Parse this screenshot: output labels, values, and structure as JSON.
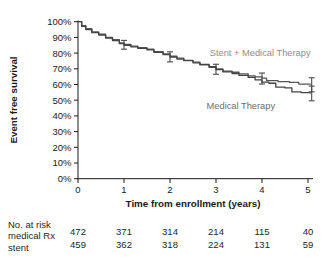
{
  "chart_data": {
    "type": "line",
    "subtype": "kaplan-meier-step",
    "title": "",
    "xlabel": "Time from enrollment (years)",
    "ylabel": "Event free survival",
    "xlim": [
      0,
      5
    ],
    "ylim": [
      0,
      100
    ],
    "grid": false,
    "legend_position": "inline-annotations",
    "x_axis": {
      "tick_values": [
        0,
        1,
        2,
        3,
        4,
        5
      ],
      "tick_labels": [
        "0",
        "1",
        "2",
        "3",
        "4",
        "5"
      ]
    },
    "y_axis": {
      "tick_values": [
        0,
        10,
        20,
        30,
        40,
        50,
        60,
        70,
        80,
        90,
        100
      ],
      "tick_labels": [
        "0%",
        "10%",
        "20%",
        "30%",
        "40%",
        "50%",
        "60%",
        "70%",
        "80%",
        "90%",
        "100%"
      ]
    },
    "series": [
      {
        "name": "Stent + Medical Therapy",
        "color": "#555555",
        "x": [
          0,
          0.08,
          0.17,
          0.3,
          0.45,
          0.6,
          0.75,
          0.9,
          1.0,
          1.15,
          1.3,
          1.5,
          1.65,
          1.85,
          2.0,
          2.15,
          2.3,
          2.5,
          2.65,
          2.85,
          3.0,
          3.15,
          3.35,
          3.5,
          3.7,
          3.85,
          4.0,
          4.1,
          4.35,
          4.6,
          4.8,
          5.05
        ],
        "values": [
          100,
          97.5,
          95.5,
          93.5,
          92,
          90,
          88.5,
          86.5,
          85.5,
          84.5,
          83.5,
          82.5,
          81,
          79.5,
          78,
          76.8,
          75.2,
          74.3,
          72.5,
          71,
          70,
          68.5,
          67.8,
          66.8,
          65.5,
          64.8,
          64,
          62.5,
          61.8,
          61.3,
          60.3,
          59.8
        ]
      },
      {
        "name": "Medical Therapy",
        "color": "#434343",
        "x": [
          0,
          0.08,
          0.17,
          0.3,
          0.45,
          0.6,
          0.75,
          0.9,
          1.0,
          1.15,
          1.3,
          1.5,
          1.65,
          1.85,
          2.0,
          2.15,
          2.3,
          2.5,
          2.65,
          2.85,
          3.0,
          3.15,
          3.35,
          3.5,
          3.7,
          3.85,
          4.0,
          4.15,
          4.3,
          4.5,
          4.65,
          4.85,
          5.05
        ],
        "values": [
          100,
          97,
          95,
          93,
          91.5,
          89.5,
          88,
          86,
          85,
          84,
          83,
          82,
          80.5,
          79,
          77.5,
          76.2,
          75.4,
          73.8,
          72.8,
          71.3,
          69.5,
          68,
          67,
          65.8,
          64.5,
          63,
          61.5,
          60.8,
          58.3,
          57.8,
          55.3,
          54.8,
          54.3
        ]
      }
    ],
    "error_bars": [
      {
        "x": 1,
        "y": 85.3,
        "err": 2.8
      },
      {
        "x": 2,
        "y": 77.6,
        "err": 3.2
      },
      {
        "x": 3,
        "y": 69.7,
        "err": 3.2
      },
      {
        "x": 4,
        "y": 63.8,
        "err": 3.5
      },
      {
        "x": 5.08,
        "y": 59.8,
        "err": 4.5
      },
      {
        "x": 5.08,
        "y": 54.3,
        "err": 4.7
      }
    ],
    "annotations": [
      {
        "text": "Stent + Medical Therapy",
        "x": 3.96,
        "y": 80,
        "color": "#8e8e8e"
      },
      {
        "text": "Medical Therapy",
        "x": 3.54,
        "y": 46.5,
        "color": "#6e6e6e"
      }
    ]
  },
  "risk_table": {
    "title": "No. at risk",
    "rows": [
      {
        "label": "medical Rx",
        "values": [
          "472",
          "371",
          "314",
          "214",
          "115",
          "40"
        ]
      },
      {
        "label": "stent",
        "values": [
          "459",
          "362",
          "318",
          "224",
          "131",
          "59"
        ]
      }
    ]
  },
  "colors": {
    "axis": "#1a1a1a",
    "tick_text": "#1a1a1a",
    "error_bar": "#4a4a4a",
    "background": "#ffffff"
  }
}
